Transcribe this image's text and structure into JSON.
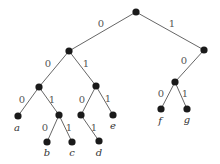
{
  "diagram": {
    "type": "binary-code-tree",
    "nodes": [
      {
        "id": "root",
        "x": 136,
        "y": 12
      },
      {
        "id": "n0",
        "x": 69,
        "y": 51
      },
      {
        "id": "n1",
        "x": 204,
        "y": 50
      },
      {
        "id": "n00",
        "x": 39,
        "y": 87
      },
      {
        "id": "n01",
        "x": 96,
        "y": 86
      },
      {
        "id": "n10",
        "x": 175,
        "y": 82
      },
      {
        "id": "a",
        "x": 18,
        "y": 116,
        "label": "a"
      },
      {
        "id": "n001",
        "x": 59,
        "y": 115
      },
      {
        "id": "n010",
        "x": 81,
        "y": 115
      },
      {
        "id": "e",
        "x": 113,
        "y": 115,
        "label": "e"
      },
      {
        "id": "f",
        "x": 161,
        "y": 109,
        "label": "f"
      },
      {
        "id": "g",
        "x": 187,
        "y": 109,
        "label": "g"
      },
      {
        "id": "b",
        "x": 47,
        "y": 142,
        "label": "b"
      },
      {
        "id": "c",
        "x": 72,
        "y": 142,
        "label": "c"
      },
      {
        "id": "d",
        "x": 99,
        "y": 141,
        "label": "d"
      }
    ],
    "edges": [
      {
        "from": "root",
        "to": "n0",
        "bit": "0",
        "lx": 101,
        "ly": 27
      },
      {
        "from": "root",
        "to": "n1",
        "bit": "1",
        "lx": 172,
        "ly": 27
      },
      {
        "from": "n0",
        "to": "n00",
        "bit": "0",
        "lx": 48,
        "ly": 67
      },
      {
        "from": "n0",
        "to": "n01",
        "bit": "1",
        "lx": 86,
        "ly": 67
      },
      {
        "from": "n1",
        "to": "n10",
        "bit": "0",
        "lx": 184,
        "ly": 64
      },
      {
        "from": "n00",
        "to": "a",
        "bit": "0",
        "lx": 22,
        "ly": 103
      },
      {
        "from": "n00",
        "to": "n001",
        "bit": "1",
        "lx": 52,
        "ly": 103
      },
      {
        "from": "n01",
        "to": "n010",
        "bit": "0",
        "lx": 82,
        "ly": 103
      },
      {
        "from": "n01",
        "to": "e",
        "bit": "1",
        "lx": 108,
        "ly": 102
      },
      {
        "from": "n10",
        "to": "f",
        "bit": "0",
        "lx": 161,
        "ly": 97
      },
      {
        "from": "n10",
        "to": "g",
        "bit": "1",
        "lx": 185,
        "ly": 97
      },
      {
        "from": "n001",
        "to": "b",
        "bit": "0",
        "lx": 45,
        "ly": 131
      },
      {
        "from": "n001",
        "to": "c",
        "bit": "1",
        "lx": 69,
        "ly": 131
      },
      {
        "from": "n010",
        "to": "d",
        "bit": "1",
        "lx": 94,
        "ly": 131
      }
    ],
    "leaf_labels": [
      {
        "text": "a",
        "x": 17,
        "y": 131
      },
      {
        "text": "b",
        "x": 47,
        "y": 156
      },
      {
        "text": "c",
        "x": 72,
        "y": 156
      },
      {
        "text": "d",
        "x": 99,
        "y": 156
      },
      {
        "text": "e",
        "x": 113,
        "y": 129
      },
      {
        "text": "f",
        "x": 160,
        "y": 124
      },
      {
        "text": "g",
        "x": 187,
        "y": 123
      }
    ]
  }
}
